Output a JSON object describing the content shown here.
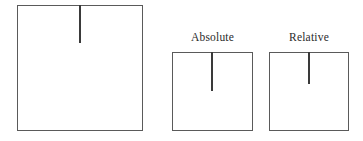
{
  "figure": {
    "background_color": "#ffffff",
    "stroke_color": "#5a5a5a",
    "tick_color": "#3a3a3a",
    "label_color": "#2b2b2b",
    "panels": [
      {
        "id": "source",
        "label": "",
        "has_label": false,
        "box": {
          "x": 17,
          "y": 5,
          "width": 126,
          "height": 126
        },
        "tick": {
          "x": 79,
          "y": 5,
          "length": 38
        }
      },
      {
        "id": "absolute",
        "label": "Absolute",
        "has_label": true,
        "box": {
          "x": 172,
          "y": 52,
          "width": 81,
          "height": 79
        },
        "tick": {
          "x": 211,
          "y": 52,
          "length": 39
        }
      },
      {
        "id": "relative",
        "label": "Relative",
        "has_label": true,
        "box": {
          "x": 269,
          "y": 52,
          "width": 80,
          "height": 79
        },
        "tick": {
          "x": 308,
          "y": 52,
          "length": 32
        }
      }
    ]
  }
}
